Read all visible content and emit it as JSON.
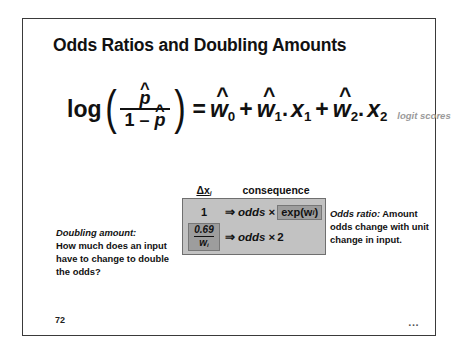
{
  "slide": {
    "title": "Odds Ratios and Doubling Amounts",
    "number": "72",
    "more_indicator": "...",
    "border_color": "#3a3a3a",
    "background": "#ffffff"
  },
  "equation": {
    "log_label": "log",
    "open_paren": "(",
    "close_paren": ")",
    "numerator": "p",
    "numerator_hat": "^",
    "denominator_one": "1 –",
    "denominator_p": "p",
    "denominator_hat": "^",
    "equals": "=",
    "terms": [
      {
        "hat": "^",
        "weight": "w",
        "weight_sub": "0",
        "sep": "",
        "variable": "",
        "variable_sub": ""
      },
      {
        "hat": "^",
        "weight": "w",
        "weight_sub": "1",
        "sep": ".",
        "variable": "x",
        "variable_sub": "1"
      },
      {
        "hat": "^",
        "weight": "w",
        "weight_sub": "2",
        "sep": ".",
        "variable": "x",
        "variable_sub": "2"
      }
    ],
    "plus": "+",
    "note": "logit scores",
    "note_color": "#9a9a9a"
  },
  "table": {
    "header_delta_x": "Δx",
    "header_delta_x_sub": "i",
    "header_consequence": "consequence",
    "fill_color": "#c2c2c2",
    "highlight_color": "#9d9d9d",
    "border_color": "#6f6f6f",
    "rows": [
      {
        "delta_value": "1",
        "arrow": "⇒",
        "odds_word": "odds",
        "operator": "×",
        "result": "exp(w",
        "result_sub": "i",
        "result_tail": ")",
        "result_highlighted": true,
        "delta_highlighted": false
      },
      {
        "delta_numerator": "0.69",
        "delta_denominator": "w",
        "delta_denominator_sub": "i",
        "arrow": "⇒",
        "odds_word": "odds",
        "operator": "×",
        "result": "2",
        "result_highlighted": false,
        "delta_highlighted": true
      }
    ]
  },
  "callouts": {
    "doubling": {
      "lead": "Doubling amount",
      "lead_colon": ":",
      "body": "How much does an input have to change to double the odds?"
    },
    "odds_ratio": {
      "lead": "Odds ratio",
      "lead_colon": ":",
      "body": "Amount odds change with unit change in input."
    }
  }
}
